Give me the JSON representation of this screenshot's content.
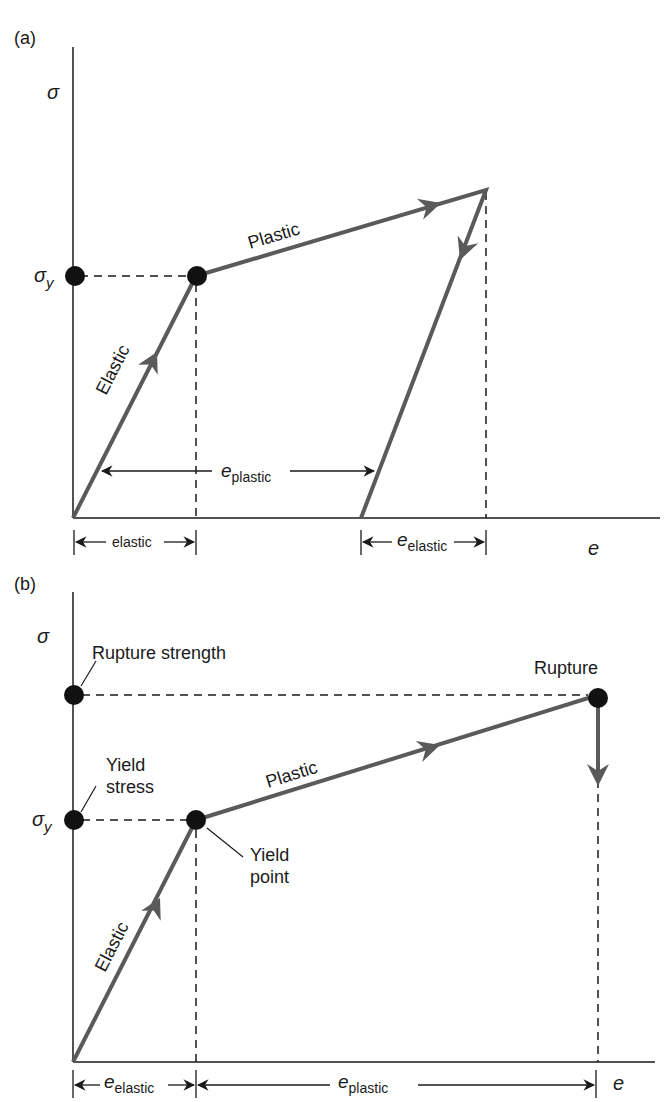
{
  "panel_a": {
    "label": "(a)",
    "y_axis_label": "σ",
    "x_axis_label": "e",
    "sigma_y_main": "σ",
    "sigma_y_sub": "y",
    "segment_elastic": "Elastic",
    "segment_plastic": "Plastic",
    "dim_plastic_main": "e",
    "dim_plastic_sub": "plastic",
    "dim_elastic_left": "elastic",
    "dim_elastic_right_main": "e",
    "dim_elastic_right_sub": "elastic"
  },
  "panel_b": {
    "label": "(b)",
    "y_axis_label": "σ",
    "x_axis_label": "e",
    "sigma_y_main": "σ",
    "sigma_y_sub": "y",
    "rupture_strength": "Rupture strength",
    "yield_stress_line1": "Yield",
    "yield_stress_line2": "stress",
    "yield_point_line1": "Yield",
    "yield_point_line2": "point",
    "rupture": "Rupture",
    "segment_elastic": "Elastic",
    "segment_plastic": "Plastic",
    "dim_elastic_main": "e",
    "dim_elastic_sub": "elastic",
    "dim_plastic_main": "e",
    "dim_plastic_sub": "plastic"
  },
  "colors": {
    "curve": "#5a5a5a",
    "axis": "#1a1a1a",
    "dot": "#111111"
  }
}
